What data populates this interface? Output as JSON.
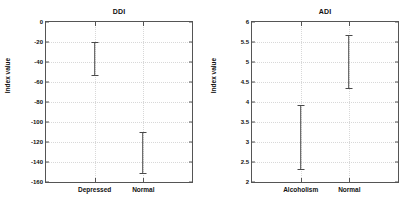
{
  "figure": {
    "background": "#ffffff",
    "line_color": "#4a4a4a",
    "axis_color": "#555555",
    "grid_color": "#d8d8d8"
  },
  "chart_data": [
    {
      "type": "errorbar",
      "panel": "left",
      "title": "DDI",
      "xlabel": "",
      "ylabel": "Index value",
      "categories": [
        "Depressed",
        "Normal"
      ],
      "series": [
        {
          "name": "Index value range",
          "intervals": [
            {
              "category": "Depressed",
              "low": -53,
              "high": -20
            },
            {
              "category": "Normal",
              "low": -151,
              "high": -110
            }
          ]
        }
      ],
      "ylim": [
        -160,
        0
      ],
      "ytick_step": 20,
      "yticks": [
        0,
        -20,
        -40,
        -60,
        -80,
        -100,
        -120,
        -140,
        -160
      ],
      "ytick_labels": [
        "0",
        "-20",
        "-40",
        "-60",
        "-80",
        "-100",
        "-120",
        "-140",
        "-160"
      ],
      "grid": true,
      "legend": "none"
    },
    {
      "type": "errorbar",
      "panel": "right",
      "title": "ADI",
      "xlabel": "",
      "ylabel": "Index value",
      "categories": [
        "Alcoholism",
        "Normal"
      ],
      "series": [
        {
          "name": "Index value range",
          "intervals": [
            {
              "category": "Alcoholism",
              "low": 2.32,
              "high": 3.93
            },
            {
              "category": "Normal",
              "low": 4.35,
              "high": 5.68
            }
          ]
        }
      ],
      "ylim": [
        2,
        6
      ],
      "ytick_step": 0.5,
      "yticks": [
        6,
        5.5,
        5,
        4.5,
        4,
        3.5,
        3,
        2.5,
        2
      ],
      "ytick_labels": [
        "6",
        "5.5",
        "5",
        "4.5",
        "4",
        "3.5",
        "3",
        "2.5",
        "2"
      ],
      "grid": true,
      "legend": "none"
    }
  ]
}
